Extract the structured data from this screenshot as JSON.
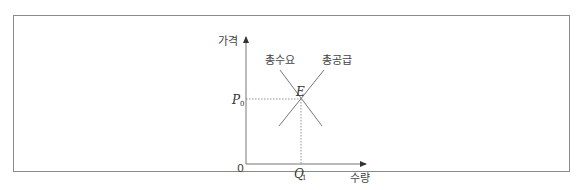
{
  "diagram": {
    "type": "supply-demand",
    "y_axis_label": "가격",
    "x_axis_label": "수량",
    "origin_label": "0",
    "demand_label": "총수요",
    "supply_label": "총공급",
    "equilibrium_label": "E",
    "price_label": "P",
    "price_subscript": "0",
    "quantity_label": "Q",
    "quantity_subscript": "1"
  },
  "colors": {
    "line": "#777777",
    "frame": "#8a8a8a",
    "text": "#333333"
  }
}
